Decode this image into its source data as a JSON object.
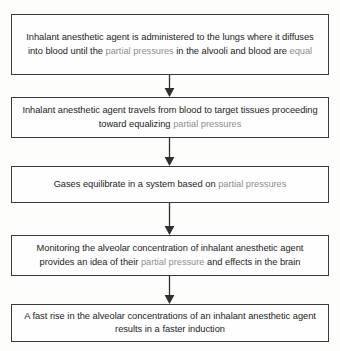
{
  "diagram": {
    "type": "vertical-flowchart",
    "accent_color": "#8e8e8e",
    "text_color": "#1d1d1d",
    "border_color": "#3a3a3a",
    "background_color": "#fdfdfc",
    "nodes": [
      {
        "id": "node-1",
        "segments": [
          {
            "text": "Inhalant anesthetic agent is administered to the lungs where it diffuses into blood until the ",
            "highlight": false
          },
          {
            "text": "partial pressures",
            "highlight": true
          },
          {
            "text": " in the alvooli and blood are ",
            "highlight": false
          },
          {
            "text": "equal",
            "highlight": true
          }
        ],
        "plain_text": "Inhalant anesthetic agent is administered to the lungs where it diffuses into blood until the partial pressures in the alvooli and blood are equal"
      },
      {
        "id": "node-2",
        "segments": [
          {
            "text": "Inhalant anesthetic agent travels from blood to target tissues proceeding toward equalizing ",
            "highlight": false
          },
          {
            "text": "partial pressures",
            "highlight": true
          }
        ],
        "plain_text": "Inhalant anesthetic agent travels from blood to target tissues proceeding toward equalizing partial pressures"
      },
      {
        "id": "node-3",
        "segments": [
          {
            "text": "Gases equilibrate in a system based on ",
            "highlight": false
          },
          {
            "text": "partial pressures",
            "highlight": true
          }
        ],
        "plain_text": "Gases equilibrate in a system based on partial pressures"
      },
      {
        "id": "node-4",
        "segments": [
          {
            "text": "Monitoring the alveolar concentration of inhalant anesthetic agent provides an idea of their ",
            "highlight": false
          },
          {
            "text": "partial pressure",
            "highlight": true
          },
          {
            "text": " and effects in the brain",
            "highlight": false
          }
        ],
        "plain_text": "Monitoring the alveolar concentration of inhalant anesthetic agent provides an idea of their partial pressure and effects in the brain"
      },
      {
        "id": "node-5",
        "segments": [
          {
            "text": "A fast rise in the alveolar concentrations of an inhalant anesthetic agent results in a faster induction",
            "highlight": false
          }
        ],
        "plain_text": "A fast rise in the alveolar concentrations of an inhalant anesthetic agent results in a faster induction"
      }
    ],
    "connectors": [
      {
        "from": "node-1",
        "to": "node-2",
        "shape": "down-arrow"
      },
      {
        "from": "node-2",
        "to": "node-3",
        "shape": "down-arrow"
      },
      {
        "from": "node-3",
        "to": "node-4",
        "shape": "down-arrow"
      },
      {
        "from": "node-4",
        "to": "node-5",
        "shape": "down-arrow"
      }
    ]
  }
}
